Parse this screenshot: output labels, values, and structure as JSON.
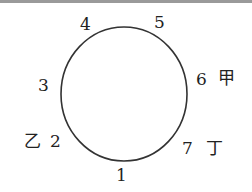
{
  "diagram": {
    "type": "circle with numbered positions",
    "points": [
      {
        "id": "1",
        "label": "1"
      },
      {
        "id": "2",
        "label": "2",
        "tag": "乙"
      },
      {
        "id": "3",
        "label": "3"
      },
      {
        "id": "4",
        "label": "4"
      },
      {
        "id": "5",
        "label": "5"
      },
      {
        "id": "6",
        "label": "6",
        "tag": "甲"
      },
      {
        "id": "7",
        "label": "7",
        "tag": "丁"
      }
    ]
  }
}
